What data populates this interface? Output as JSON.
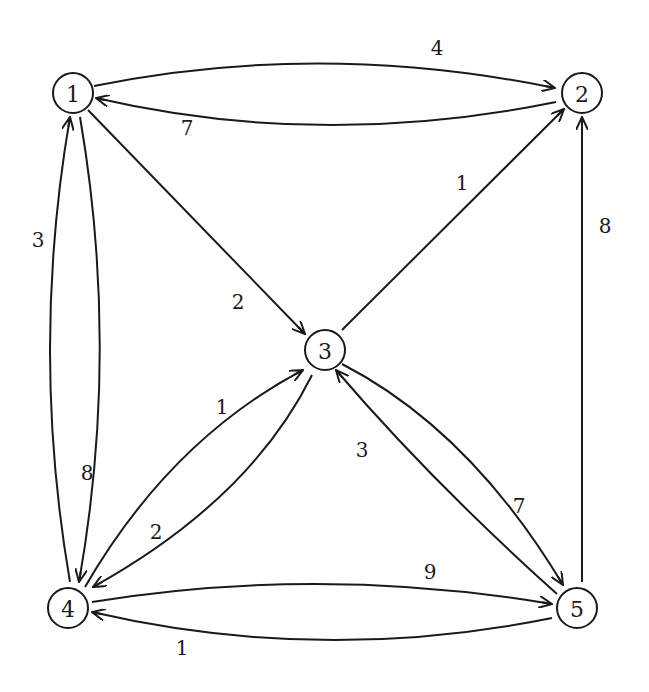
{
  "diagram": {
    "type": "directed-weighted-graph",
    "nodes": [
      {
        "id": "1",
        "label": "1",
        "x": 73,
        "y": 93
      },
      {
        "id": "2",
        "label": "2",
        "x": 582,
        "y": 93
      },
      {
        "id": "3",
        "label": "3",
        "x": 325,
        "y": 350
      },
      {
        "id": "4",
        "label": "4",
        "x": 68,
        "y": 608
      },
      {
        "id": "5",
        "label": "5",
        "x": 577,
        "y": 608
      }
    ],
    "edges": [
      {
        "from": "1",
        "to": "2",
        "weight": "4",
        "path": "M 94 86 Q 320 40 555 88",
        "label_x": 437,
        "label_y": 48
      },
      {
        "from": "2",
        "to": "1",
        "weight": "7",
        "path": "M 556 102 Q 320 150 96 98",
        "label_x": 187,
        "label_y": 128
      },
      {
        "from": "1",
        "to": "3",
        "weight": "2",
        "path": "M 88 110 L 305 334",
        "label_x": 238,
        "label_y": 302
      },
      {
        "from": "3",
        "to": "2",
        "weight": "1",
        "path": "M 342 330 L 564 109",
        "label_x": 462,
        "label_y": 183
      },
      {
        "from": "5",
        "to": "2",
        "weight": "8",
        "path": "M 582 582 L 582 117",
        "label_x": 605,
        "label_y": 226
      },
      {
        "from": "4",
        "to": "1",
        "weight": "3",
        "path": "M 70 582 Q 30 350 70 117",
        "label_x": 38,
        "label_y": 240
      },
      {
        "from": "1",
        "to": "4",
        "weight": "8",
        "path": "M 80 117 Q 120 350 79 582",
        "label_x": 87,
        "label_y": 473
      },
      {
        "from": "4",
        "to": "3",
        "weight": "1",
        "path": "M 85 587 Q 170 440 303 370",
        "label_x": 222,
        "label_y": 407
      },
      {
        "from": "3",
        "to": "4",
        "weight": "2",
        "path": "M 312 375 Q 250 500 93 587",
        "label_x": 156,
        "label_y": 532
      },
      {
        "from": "3",
        "to": "5",
        "weight": "7",
        "path": "M 342 364 Q 470 430 563 585",
        "label_x": 519,
        "label_y": 506
      },
      {
        "from": "5",
        "to": "3",
        "weight": "3",
        "path": "M 557 594 Q 430 480 336 370",
        "label_x": 362,
        "label_y": 450
      },
      {
        "from": "4",
        "to": "5",
        "weight": "9",
        "path": "M 92 602 Q 320 565 552 604",
        "label_x": 430,
        "label_y": 572
      },
      {
        "from": "5",
        "to": "4",
        "weight": "1",
        "path": "M 552 618 Q 320 665 92 612",
        "label_x": 182,
        "label_y": 648
      }
    ],
    "colors": {
      "stroke": "#1a1a1a",
      "background": "#ffffff"
    }
  }
}
